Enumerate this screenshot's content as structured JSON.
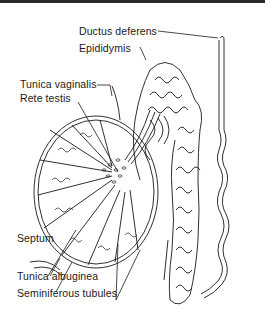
{
  "diagram": {
    "labels": {
      "ductus_deferens": "Ductus deferens",
      "epididymis": "Epididymis",
      "tunica_vaginalis": "Tunica vaginalis",
      "rete_testis": "Rete testis",
      "septum": "Septum",
      "tunica_albuginea": "Tunica albuginea",
      "seminiferous_tubules": "Seminiferous tubules"
    },
    "colors": {
      "line": "#1a1a1a",
      "background": "#ffffff"
    }
  }
}
